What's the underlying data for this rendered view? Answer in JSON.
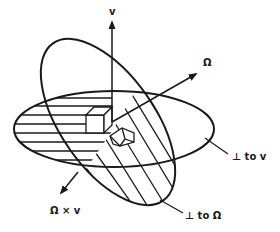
{
  "diagram": {
    "title": "",
    "axes": {
      "v": {
        "label": "v"
      },
      "omega": {
        "label": "Ω"
      },
      "omega_cross_v": {
        "label": "Ω × v"
      }
    },
    "planes": {
      "perp_v": {
        "label": "⊥ to v"
      },
      "perp_omega": {
        "label": "⊥ to Ω"
      }
    },
    "colors": {
      "ink": "#1a1a1a",
      "background": "#ffffff"
    }
  }
}
